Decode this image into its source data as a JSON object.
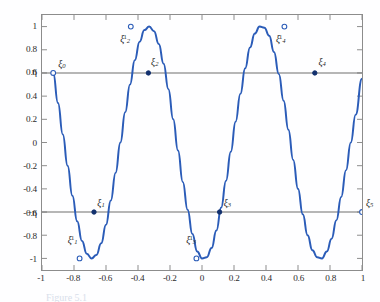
{
  "figure": {
    "caption": "Figure 5.1",
    "colors": {
      "curve": "#2b5cb8",
      "reference_line": "#6f6f6f",
      "axis": "#8c8c8c",
      "text": "#2a2a2a"
    }
  },
  "axes": {
    "xlim": [
      -1,
      1
    ],
    "ylim": [
      -1.1,
      1.1
    ],
    "xticks": [
      "-1",
      "-0.8",
      "-0.6",
      "-0.4",
      "-0.2",
      "0",
      "0.2",
      "0.4",
      "0.6",
      "0.8",
      "1"
    ],
    "xtick_values": [
      -1,
      -0.8,
      -0.6,
      -0.4,
      -0.2,
      0,
      0.2,
      0.4,
      0.6,
      0.8,
      1
    ],
    "yticks": [
      "1",
      "0.8",
      "0.6",
      "0.4",
      "0.2",
      "0",
      "-0.2",
      "-0.4",
      "-0.6",
      "-0.8",
      "-1"
    ],
    "ytick_values": [
      1,
      0.8,
      0.6,
      0.4,
      0.2,
      0,
      -0.2,
      -0.4,
      -0.6,
      -0.8,
      -1
    ],
    "xlabel": "",
    "ylabel": "",
    "grid": false
  },
  "chart_data": {
    "type": "line",
    "title": "",
    "xlabel": "",
    "ylabel": "",
    "xlim": [
      -1,
      1
    ],
    "ylim": [
      -1.1,
      1.1
    ],
    "grid": false,
    "legend": null,
    "series": [
      {
        "name": "equioscillating error curve",
        "color": "#2b5cb8",
        "x": [
          -0.93,
          -0.9,
          -0.87,
          -0.84,
          -0.81,
          -0.78,
          -0.75,
          -0.72,
          -0.69,
          -0.66,
          -0.63,
          -0.6,
          -0.57,
          -0.54,
          -0.51,
          -0.48,
          -0.45,
          -0.42,
          -0.39,
          -0.36,
          -0.33,
          -0.3,
          -0.27,
          -0.24,
          -0.21,
          -0.18,
          -0.15,
          -0.12,
          -0.09,
          -0.06,
          -0.03,
          0.0,
          0.03,
          0.06,
          0.09,
          0.12,
          0.15,
          0.18,
          0.21,
          0.24,
          0.27,
          0.3,
          0.33,
          0.36,
          0.39,
          0.42,
          0.45,
          0.48,
          0.51,
          0.54,
          0.57,
          0.6,
          0.63,
          0.66,
          0.69,
          0.72,
          0.75,
          0.78,
          0.81,
          0.84,
          0.87,
          0.9,
          0.93,
          0.96,
          1.0
        ],
        "y": [
          0.6,
          0.34,
          0.07,
          -0.2,
          -0.46,
          -0.68,
          -0.85,
          -0.96,
          -1.0,
          -0.97,
          -0.87,
          -0.71,
          -0.5,
          -0.26,
          0.0,
          0.26,
          0.5,
          0.71,
          0.87,
          0.97,
          1.0,
          0.96,
          0.85,
          0.68,
          0.46,
          0.2,
          -0.07,
          -0.34,
          -0.58,
          -0.79,
          -0.94,
          -1.0,
          -0.99,
          -0.91,
          -0.76,
          -0.56,
          -0.33,
          -0.08,
          0.18,
          0.42,
          0.64,
          0.82,
          0.94,
          1.0,
          0.99,
          0.92,
          0.78,
          0.59,
          0.36,
          0.11,
          -0.15,
          -0.4,
          -0.62,
          -0.8,
          -0.93,
          -0.99,
          -1.0,
          -0.94,
          -0.83,
          -0.67,
          -0.47,
          -0.24,
          0.0,
          0.24,
          0.55
        ],
        "comment_shape": "oscillates between +1 and -1 with 4 interior extrema"
      }
    ],
    "reference_lines": [
      {
        "name": "eta",
        "y": 0.6,
        "label": "η",
        "style": "solid",
        "color": "#6f6f6f"
      },
      {
        "name": "minus-eta",
        "y": -0.6,
        "label": "−η",
        "style": "solid",
        "color": "#6f6f6f"
      }
    ],
    "annotations": [
      {
        "name": "xi-0",
        "label_base": "ξ",
        "sub": "0",
        "sup": "",
        "x": -0.93,
        "y": 0.6,
        "marker": "open",
        "label_dx": 6,
        "label_dy": -12
      },
      {
        "name": "xi-1-prime",
        "label_base": "ξ",
        "sub": "1",
        "sup": "1",
        "x": -0.765,
        "y": -1.0,
        "marker": "open",
        "label_dx": -11,
        "label_dy": -24
      },
      {
        "name": "xi-1",
        "label_base": "ξ",
        "sub": "1",
        "sup": "",
        "x": -0.675,
        "y": -0.6,
        "marker": "filled",
        "label_dx": 4,
        "label_dy": -14
      },
      {
        "name": "xi-2-prime",
        "label_base": "ξ",
        "sub": "2",
        "sup": "1",
        "x": -0.445,
        "y": 1.0,
        "marker": "open",
        "label_dx": -10,
        "label_dy": 8
      },
      {
        "name": "xi-2",
        "label_base": "ξ",
        "sub": "2",
        "sup": "",
        "x": -0.335,
        "y": 0.6,
        "marker": "filled",
        "label_dx": 3,
        "label_dy": -14
      },
      {
        "name": "xi-3-prime",
        "label_base": "ξ",
        "sub": "3",
        "sup": "1",
        "x": -0.035,
        "y": -1.0,
        "marker": "open",
        "label_dx": -10,
        "label_dy": -24
      },
      {
        "name": "xi-3",
        "label_base": "ξ",
        "sub": "3",
        "sup": "",
        "x": 0.11,
        "y": -0.6,
        "marker": "filled",
        "label_dx": 4,
        "label_dy": -14
      },
      {
        "name": "xi-4-prime",
        "label_base": "ξ",
        "sub": "4",
        "sup": "1",
        "x": 0.515,
        "y": 1.0,
        "marker": "open",
        "label_dx": -9,
        "label_dy": 8
      },
      {
        "name": "xi-4",
        "label_base": "ξ",
        "sub": "4",
        "sup": "",
        "x": 0.705,
        "y": 0.6,
        "marker": "filled",
        "label_dx": 3,
        "label_dy": -14
      },
      {
        "name": "xi-5",
        "label_base": "ξ",
        "sub": "5",
        "sup": "",
        "x": 1.0,
        "y": -0.6,
        "marker": "open",
        "label_dx": 3,
        "label_dy": -14
      }
    ]
  }
}
